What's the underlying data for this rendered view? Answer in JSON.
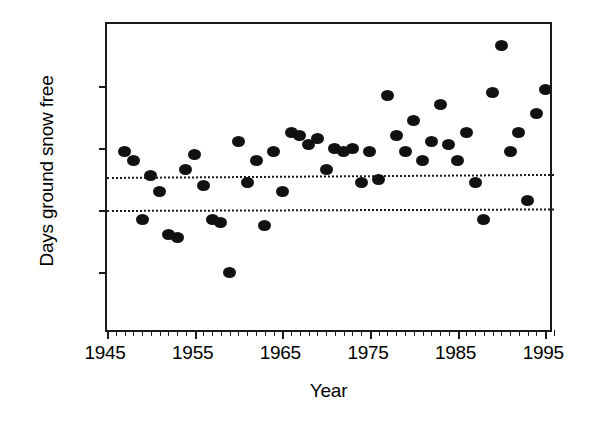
{
  "chart_data": {
    "type": "scatter",
    "title": "",
    "xlabel": "Year",
    "ylabel": "Days ground snow free",
    "xlim": [
      1945,
      1996
    ],
    "ylim": [
      40,
      140
    ],
    "xticks": [
      1945,
      1955,
      1965,
      1975,
      1985,
      1995
    ],
    "xtick_labels": [
      "1945",
      "1955",
      "1965",
      "1975",
      "1985",
      "1995"
    ],
    "xminor_step": 1,
    "yticks": [
      40,
      60,
      80,
      100,
      120,
      140
    ],
    "ytick_labels": [
      "40",
      "60",
      "80",
      "100",
      "120",
      "140"
    ],
    "grid": false,
    "legend": null,
    "marker": "filled-circle",
    "marker_color": "#111111",
    "reference_lines": [
      {
        "name": "upper-dashed-line",
        "style": "dotted",
        "y_left": 90.5,
        "y_right": 91.5
      },
      {
        "name": "lower-dashed-line",
        "style": "dotted",
        "y_left": 80.0,
        "y_right": 80.5
      }
    ],
    "x": [
      1947,
      1948,
      1949,
      1950,
      1951,
      1952,
      1953,
      1954,
      1955,
      1956,
      1957,
      1958,
      1959,
      1960,
      1961,
      1962,
      1963,
      1964,
      1965,
      1966,
      1967,
      1968,
      1969,
      1970,
      1971,
      1972,
      1973,
      1974,
      1975,
      1976,
      1977,
      1978,
      1979,
      1980,
      1981,
      1982,
      1983,
      1984,
      1985,
      1986,
      1987,
      1988,
      1989,
      1990,
      1991,
      1992,
      1993,
      1994,
      1995
    ],
    "y": [
      99,
      96,
      77,
      91,
      86,
      72,
      71,
      93,
      98,
      88,
      77,
      76,
      60,
      102,
      89,
      96,
      75,
      99,
      86,
      105,
      104,
      101,
      103,
      93,
      100,
      99,
      100,
      89,
      99,
      90,
      117,
      104,
      99,
      109,
      96,
      102,
      114,
      101,
      96,
      105,
      89,
      77,
      118,
      133,
      99,
      105,
      83,
      111,
      119
    ],
    "series_name": "Days ground snow free"
  },
  "axes": {
    "x_title": "Year",
    "y_title": "Days ground snow free"
  }
}
